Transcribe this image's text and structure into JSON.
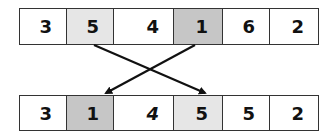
{
  "diagram": {
    "before": {
      "cells": [
        {
          "value": "3",
          "highlight": "none"
        },
        {
          "value": "5",
          "highlight": "light"
        },
        {
          "value": "4",
          "highlight": "none"
        },
        {
          "value": "1",
          "highlight": "dark"
        },
        {
          "value": "6",
          "highlight": "none"
        },
        {
          "value": "2",
          "highlight": "none"
        }
      ]
    },
    "after": {
      "cells": [
        {
          "value": "3",
          "highlight": "none"
        },
        {
          "value": "1",
          "highlight": "dark"
        },
        {
          "value": "4",
          "highlight": "none",
          "italic": true
        },
        {
          "value": "5",
          "highlight": "light"
        },
        {
          "value": "5",
          "highlight": "none"
        },
        {
          "value": "2",
          "highlight": "none"
        }
      ]
    },
    "swap": {
      "from_index": 1,
      "to_index": 3
    },
    "colors": {
      "light": "#e6e6e6",
      "dark": "#c6c6c6",
      "none": "#ffffff",
      "arrow": "#111111"
    }
  }
}
